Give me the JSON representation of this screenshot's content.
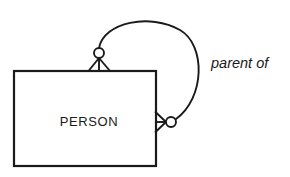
{
  "diagram": {
    "type": "entity-relationship-diagram",
    "notation": "crow's foot",
    "background_color": "#ffffff",
    "line_color": "#1a1a1a",
    "entities": [
      {
        "name": "PERSON",
        "label": "PERSON",
        "shape": "rectangle",
        "x": 14,
        "y": 71,
        "width": 142,
        "height": 95,
        "label_x": 89,
        "label_y": 126
      }
    ],
    "relationships": [
      {
        "name": "parent-of",
        "label": "parent of",
        "label_x": 211,
        "label_y": 68,
        "recursive": true,
        "from_entity": "PERSON",
        "to_entity": "PERSON",
        "arc_path": "M 99 48 C 104 22, 150 13, 180 30 C 206 45, 205 98, 176 119"
      }
    ],
    "connectors": [
      {
        "name": "top-connector",
        "cardinality": "zero-or-many",
        "optional_circle": {
          "cx": 99,
          "cy": 53,
          "r": 5
        },
        "crow_foot": {
          "apex_x": 99,
          "apex_y": 58,
          "legs": [
            {
              "x": 89,
              "y": 71
            },
            {
              "x": 99,
              "y": 71
            },
            {
              "x": 110,
              "y": 71
            }
          ]
        },
        "attached_edge": "top"
      },
      {
        "name": "right-connector",
        "cardinality": "zero-or-many",
        "optional_circle": {
          "cx": 171,
          "cy": 122,
          "r": 5
        },
        "crow_foot": {
          "apex_x": 166,
          "apex_y": 122,
          "legs": [
            {
              "x": 156,
              "y": 112
            },
            {
              "x": 156,
              "y": 122
            },
            {
              "x": 156,
              "y": 132
            }
          ]
        },
        "attached_edge": "right"
      }
    ]
  }
}
